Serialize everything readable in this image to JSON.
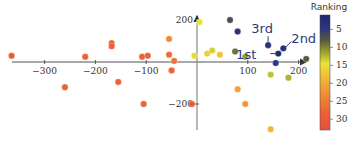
{
  "chart_data": {
    "type": "scatter",
    "title": "",
    "xlabel": "",
    "ylabel": "",
    "xlim": [
      -370,
      225
    ],
    "ylim": [
      -330,
      230
    ],
    "x_ticks": [
      -300,
      -200,
      -100,
      100,
      200
    ],
    "x_tick_labels": [
      "−300",
      "−200",
      "−100",
      "100",
      "200"
    ],
    "y_ticks": [
      200,
      -200
    ],
    "y_tick_labels": [
      "200",
      "−200"
    ],
    "grid": false,
    "colorbar": {
      "title": "Ranking",
      "ticks": [
        5,
        10,
        15,
        20,
        25,
        30
      ],
      "range": [
        1,
        33
      ],
      "colormap": "plasma-like (navy → olive → yellow → orange → red)"
    },
    "annotations": [
      {
        "text": "1st",
        "x": 160,
        "y": 40
      },
      {
        "text": "2nd",
        "x": 170,
        "y": 60
      },
      {
        "text": "3rd",
        "x": 140,
        "y": 80
      }
    ],
    "points": [
      {
        "x": -365,
        "y": 30,
        "rank": 29
      },
      {
        "x": -260,
        "y": -120,
        "rank": 28
      },
      {
        "x": -220,
        "y": 25,
        "rank": 28
      },
      {
        "x": -168,
        "y": 90,
        "rank": 28
      },
      {
        "x": -168,
        "y": 75,
        "rank": 28
      },
      {
        "x": -155,
        "y": -95,
        "rank": 27
      },
      {
        "x": -108,
        "y": 25,
        "rank": 27
      },
      {
        "x": -97,
        "y": 30,
        "rank": 27
      },
      {
        "x": -105,
        "y": -200,
        "rank": 27
      },
      {
        "x": -55,
        "y": 110,
        "rank": 22
      },
      {
        "x": -55,
        "y": 35,
        "rank": 26
      },
      {
        "x": -45,
        "y": 5,
        "rank": 25
      },
      {
        "x": -50,
        "y": -40,
        "rank": 27
      },
      {
        "x": -10,
        "y": -200,
        "rank": 30
      },
      {
        "x": 5,
        "y": 190,
        "rank": 14
      },
      {
        "x": -5,
        "y": 30,
        "rank": 15
      },
      {
        "x": 20,
        "y": 40,
        "rank": 16
      },
      {
        "x": 30,
        "y": 55,
        "rank": 13
      },
      {
        "x": 45,
        "y": 35,
        "rank": 17
      },
      {
        "x": 75,
        "y": 50,
        "rank": 8
      },
      {
        "x": 95,
        "y": 25,
        "rank": 10
      },
      {
        "x": 65,
        "y": 200,
        "rank": 6
      },
      {
        "x": 80,
        "y": 145,
        "rank": 3
      },
      {
        "x": 140,
        "y": 80,
        "rank": 3
      },
      {
        "x": 160,
        "y": 40,
        "rank": 1
      },
      {
        "x": 170,
        "y": 65,
        "rank": 2
      },
      {
        "x": 155,
        "y": -5,
        "rank": 4
      },
      {
        "x": 215,
        "y": 15,
        "rank": 7
      },
      {
        "x": 145,
        "y": -60,
        "rank": 12
      },
      {
        "x": 180,
        "y": -75,
        "rank": 11
      },
      {
        "x": 80,
        "y": -130,
        "rank": 20
      },
      {
        "x": 95,
        "y": -200,
        "rank": 21
      },
      {
        "x": 145,
        "y": -320,
        "rank": 18
      }
    ]
  }
}
